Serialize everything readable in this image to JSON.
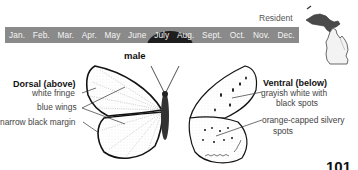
{
  "flight_calendar": {
    "months": [
      "Jan.",
      "Feb.",
      "Mar.",
      "Apr.",
      "May",
      "June",
      "July",
      "Aug.",
      "Sept.",
      "Oct.",
      "Nov.",
      "Dec."
    ],
    "highlighted_months": [
      "June",
      "July"
    ],
    "bar_color": "#8a8a8a",
    "highlight_color": "#1e1e1e"
  },
  "range_map": {
    "label": "Resident",
    "region": "Michigan"
  },
  "figure": {
    "sex_label": "male",
    "dorsal": {
      "title": "Dorsal (above)",
      "annotations": [
        "white fringe",
        "blue wings",
        "narrow black margin"
      ]
    },
    "ventral": {
      "title": "Ventral (below)",
      "annotations": [
        "grayish white with black spots",
        "orange-capped silvery spots"
      ],
      "annotation_lines": [
        "grayish white with",
        "black spots",
        "orange-capped silvery",
        "spots"
      ]
    }
  },
  "page_number": "101"
}
